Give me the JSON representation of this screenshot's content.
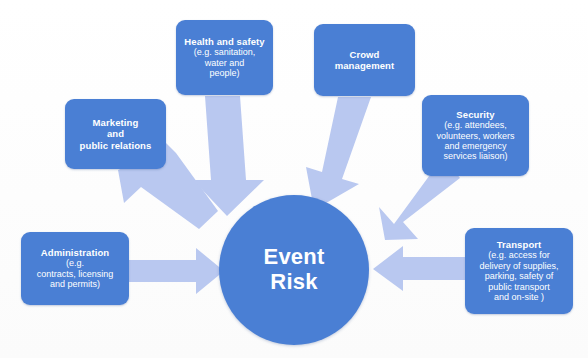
{
  "diagram": {
    "type": "hub-and-spoke",
    "title": "Event Risk",
    "background_color": "#fdfdfd",
    "node_color": "#4a7fd4",
    "arrow_color": "#b9c8f0",
    "text_color": "#ffffff",
    "center": {
      "label": "Event\nRisk"
    },
    "nodes": [
      {
        "id": "health-and-safety",
        "title": "Health and safety",
        "detail": "(e.g. sanitation,\nwater and\npeople)"
      },
      {
        "id": "crowd-management",
        "title": "Crowd\nmanagement",
        "detail": ""
      },
      {
        "id": "marketing-and-public-relations",
        "title": "Marketing\nand\npublic relations",
        "detail": ""
      },
      {
        "id": "security",
        "title": "Security",
        "detail": "(e.g. attendees,\nvolunteers, workers\nand emergency\nservices liaison)"
      },
      {
        "id": "administration",
        "title": "Administration",
        "detail": "(e.g.\ncontracts, licensing\nand permits)"
      },
      {
        "id": "transport",
        "title": "Transport",
        "detail": "(e.g. access for\ndelivery of supplies,\nparking, safety of\npublic transport\nand on-site )"
      }
    ],
    "arrows": [
      {
        "id": "arrow-marketing-to-center",
        "from": "marketing-and-public-relations",
        "to": "center",
        "direction": "down-right"
      },
      {
        "id": "arrow-health-to-center",
        "from": "health-and-safety",
        "to": "center",
        "direction": "down"
      },
      {
        "id": "arrow-crowd-to-center",
        "from": "crowd-management",
        "to": "center",
        "direction": "down-left"
      },
      {
        "id": "arrow-security-to-center",
        "from": "security",
        "to": "center",
        "direction": "down-left"
      },
      {
        "id": "arrow-administration-to-center",
        "from": "administration",
        "to": "center",
        "direction": "right"
      },
      {
        "id": "arrow-transport-to-center",
        "from": "transport",
        "to": "center",
        "direction": "left"
      }
    ]
  }
}
